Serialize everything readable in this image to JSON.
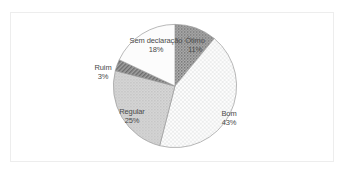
{
  "header": {
    "clipped_text": ""
  },
  "card": {
    "background": "#ffffff",
    "border_color": "#ededed"
  },
  "chart_data": {
    "type": "pie",
    "title": "",
    "subtitle": "",
    "xlabel": "",
    "ylabel": "",
    "legend_position": "none",
    "grid": false,
    "labels_inside": true,
    "categories": [
      "Ótimo",
      "Bom",
      "Regular",
      "Ruim",
      "Sem declaração"
    ],
    "values": [
      11,
      43,
      25,
      3,
      18
    ],
    "value_suffix": "%",
    "start_angle_deg": 0,
    "direction": "clockwise",
    "slices": [
      {
        "label": "Ótimo",
        "value": 11,
        "value_text": "11%",
        "color": "#a6a6a6",
        "pattern": "dense-dots-dark",
        "start_deg": 0,
        "end_deg": 39.6
      },
      {
        "label": "Bom",
        "value": 43,
        "value_text": "43%",
        "color": "#f2f2f2",
        "pattern": "light-checker",
        "start_deg": 39.6,
        "end_deg": 194.4
      },
      {
        "label": "Regular",
        "value": 25,
        "value_text": "25%",
        "color": "#cfcfcf",
        "pattern": "medium-dots",
        "start_deg": 194.4,
        "end_deg": 284.4
      },
      {
        "label": "Ruim",
        "value": 3,
        "value_text": "3%",
        "color": "#8c8c8c",
        "pattern": "diagonal-hatch-dark",
        "start_deg": 284.4,
        "end_deg": 295.2
      },
      {
        "label": "Sem declaração",
        "value": 18,
        "value_text": "18%",
        "color": "#fbfbfb",
        "pattern": "plain-white",
        "start_deg": 295.2,
        "end_deg": 360
      }
    ],
    "geometry": {
      "center_x": 165,
      "center_y": 73,
      "radius": 62
    }
  }
}
